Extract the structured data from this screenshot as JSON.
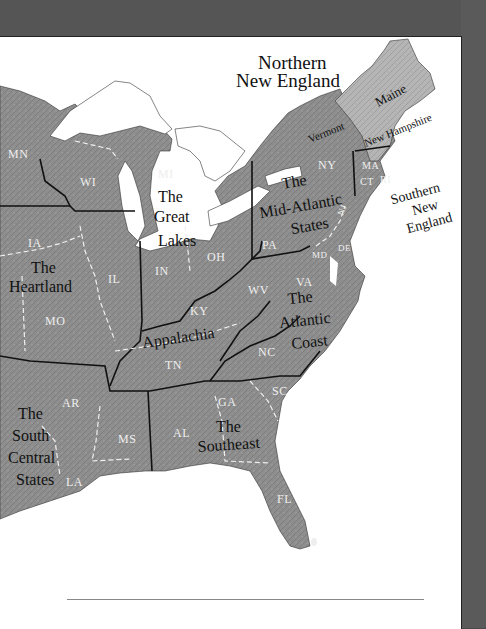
{
  "map": {
    "title_line1": "Northern",
    "title_line2": "New England",
    "regions": {
      "great_lakes": [
        "The",
        "Great",
        "Lakes"
      ],
      "heartland": [
        "The",
        "Heartland"
      ],
      "mid_atlantic": [
        "The",
        "Mid-Atlantic",
        "States"
      ],
      "appalachia": [
        "Appalachia"
      ],
      "atlantic_coast": [
        "The",
        "Atlantic",
        "Coast"
      ],
      "south_central": [
        "The",
        "South",
        "Central",
        "States"
      ],
      "southeast": [
        "The",
        "Southeast"
      ],
      "southern_new_england": [
        "Southern",
        "New",
        "England"
      ]
    },
    "ne_states": {
      "maine": "Maine",
      "vermont": "Vermont",
      "new_hampshire": "New Hampshire"
    },
    "states": {
      "mn": "MN",
      "wi": "WI",
      "mi": "MI",
      "ia": "IA",
      "il": "IL",
      "in": "IN",
      "oh": "OH",
      "mo": "MO",
      "ky": "KY",
      "wv": "WV",
      "va": "VA",
      "pa": "PA",
      "ny": "NY",
      "ma": "MA",
      "ct": "CT",
      "ri": "RI",
      "md": "MD",
      "de": "DE",
      "nj": "NJ",
      "tn": "TN",
      "nc": "NC",
      "sc": "SC",
      "ga": "GA",
      "al": "AL",
      "ms": "MS",
      "ar": "AR",
      "la": "LA",
      "fl": "FL"
    },
    "colors": {
      "land": "#8f8f8f",
      "land_light": "#b8b8b8",
      "water": "#ffffff",
      "border_region": "#111111",
      "border_state": "#f0f0f0",
      "background": "#4a4a4a"
    }
  }
}
